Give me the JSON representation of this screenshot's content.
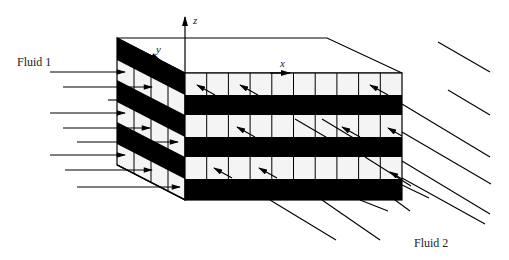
{
  "diagram": {
    "type": "cross-flow heat exchanger schematic",
    "labels": {
      "fluid1": "Fluid 1",
      "fluid2": "Fluid 2",
      "axis_x": "x",
      "axis_y": "y",
      "axis_z": "z"
    },
    "colors": {
      "ink": "#000000",
      "background": "#ffffff",
      "channel_fill": "#f4f4f4"
    },
    "front_face": {
      "columns": 10,
      "white_rows": 3,
      "black_rows": 3
    },
    "left_face": {
      "columns": 4,
      "white_rows": 3,
      "black_rows": 4
    },
    "fluid1_arrow_count": 12,
    "fluid2_line_count": 14
  }
}
